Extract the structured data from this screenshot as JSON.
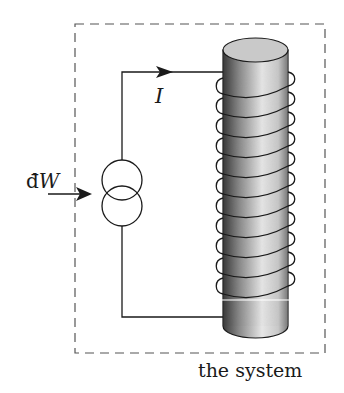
{
  "diagram": {
    "labels": {
      "work": "đW",
      "work_d": "đ",
      "work_w": "W",
      "current": "I",
      "system": "the system"
    },
    "elements": {
      "system_boundary": {
        "style": "dashed",
        "x": 75,
        "y": 24,
        "width": 250,
        "height": 329
      },
      "current_source": {
        "symbol": "double-circle current source",
        "cx": 122,
        "cy_top": 180,
        "cy_bottom": 206,
        "r": 20
      },
      "solenoid": {
        "core": "shaded cylinder",
        "x_left": 223,
        "x_right": 288,
        "top_y": 50,
        "bottom_y": 326,
        "turns": 11
      },
      "wire_top_y": 72,
      "wire_bottom_y": 317,
      "current_arrow": {
        "direction": "right",
        "x": 170,
        "y": 72
      },
      "work_arrow": {
        "direction": "right",
        "x1": 50,
        "x2": 90,
        "y": 194
      }
    },
    "colors": {
      "line": "#1a1a1a",
      "dash": "#555555",
      "background": "#ffffff"
    }
  }
}
